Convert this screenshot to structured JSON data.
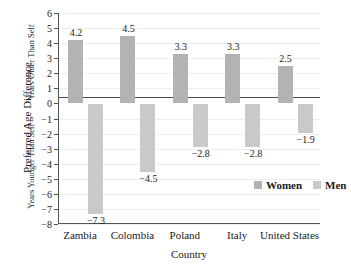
{
  "chart_data": {
    "type": "bar",
    "title": "",
    "xlabel": "Country",
    "ylabel": "Preferred Age Difference",
    "ylabel_upper": "Years Older Than Self",
    "ylabel_lower": "Years Younger Than Self",
    "categories": [
      "Zambia",
      "Colombia",
      "Poland",
      "Italy",
      "United States"
    ],
    "series": [
      {
        "name": "Women",
        "color": "#b3b3b3",
        "values": [
          4.2,
          4.5,
          3.3,
          3.3,
          2.5
        ],
        "labels": [
          "4.2",
          "4.5",
          "3.3",
          "3.3",
          "2.5"
        ]
      },
      {
        "name": "Men",
        "color": "#c9c9c9",
        "values": [
          -7.3,
          -4.5,
          -2.8,
          -2.8,
          -1.9
        ],
        "labels": [
          "−7.3",
          "−4.5",
          "−2.8",
          "−2.8",
          "−1.9"
        ]
      }
    ],
    "ylim": [
      -8,
      6
    ],
    "ytick_values": [
      6,
      5,
      4,
      3,
      2,
      1,
      0,
      -1,
      -2,
      -3,
      -4,
      -5,
      -6,
      -7,
      -8
    ],
    "ytick_labels": [
      "6",
      "5",
      "4",
      "3",
      "2",
      "1",
      "0",
      "−1",
      "−2",
      "−3",
      "−4",
      "−5",
      "−6",
      "−7",
      "−8"
    ],
    "grid": true,
    "legend_position": "inside-lower-right"
  },
  "legend": {
    "items": [
      {
        "label": "Women",
        "color": "#b3b3b3"
      },
      {
        "label": "Men",
        "color": "#c9c9c9"
      }
    ]
  }
}
